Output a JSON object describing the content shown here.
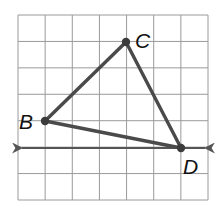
{
  "diagram": {
    "type": "geometry-grid",
    "grid": {
      "columns": 7,
      "rows": 7,
      "line_color": "#9a9a9a",
      "border_color": "#8c8c8c"
    },
    "points": [
      {
        "id": "C",
        "label": "C",
        "grid": [
          4,
          1
        ]
      },
      {
        "id": "B",
        "label": "B",
        "grid": [
          1,
          4
        ]
      },
      {
        "id": "D",
        "label": "D",
        "grid": [
          6,
          5
        ]
      }
    ],
    "triangle": {
      "vertices": [
        "B",
        "C",
        "D"
      ],
      "stroke": "#4a4a4a"
    },
    "line": {
      "through": "D",
      "direction": "horizontal",
      "arrows": "both",
      "stroke": "#555555"
    }
  }
}
